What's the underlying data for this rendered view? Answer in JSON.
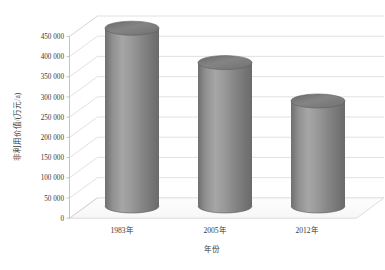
{
  "chart_data": {
    "type": "bar",
    "title": "",
    "subtitle": "",
    "xlabel": "年份",
    "ylabel": "非利用价值/(万元/a)",
    "categories": [
      "1983年",
      "2005年",
      "2012年"
    ],
    "values": [
      440000,
      355000,
      260000
    ],
    "series": [
      {
        "name": "非利用价值",
        "values": [
          440000,
          355000,
          260000
        ]
      }
    ],
    "ytick_labels": [
      "0",
      "50 000",
      "100 000",
      "150 000",
      "200 000",
      "250 000",
      "300 000",
      "350 000",
      "400 000",
      "450 000"
    ],
    "ytick_values": [
      0,
      50000,
      100000,
      150000,
      200000,
      250000,
      300000,
      350000,
      400000,
      450000
    ],
    "ylim": [
      0,
      450000
    ],
    "ytick_step": 50000,
    "grid": true,
    "grid_axis": "y",
    "legend": false,
    "legend_position": "none",
    "style": "3d-cylinder",
    "bar_shape": "cylinder",
    "colors": {
      "bar_light": "#a8a8a8",
      "bar_mid": "#8c8c8c",
      "bar_dark": "#6e6e6e",
      "bar_top": "#7d7d7d",
      "bar_top_rim": "#626262",
      "gridline": "#d9d9d9",
      "axis_line": "#bfbfbf",
      "floor": "#fcfcfc",
      "text": "#3a3a3a",
      "background": "#ffffff"
    }
  }
}
